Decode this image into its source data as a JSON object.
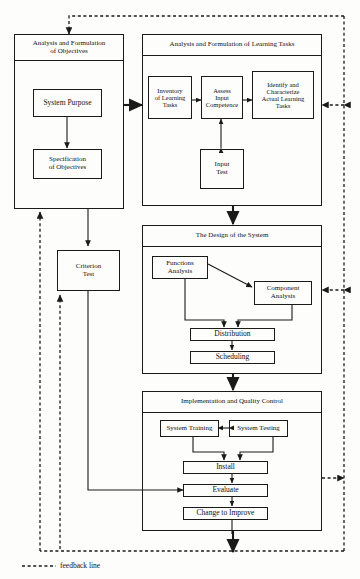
{
  "diagram": {
    "legend": {
      "feedback_label": "feedback line"
    },
    "colors": {
      "line": "#1a1a1a",
      "background": "#fdfdfc",
      "text": "#111111"
    },
    "panels": [
      {
        "id": "analysis-objectives",
        "title": "Analysis and Formulation of Objectives",
        "title_lines": [
          "Analysis and Formulation",
          "of Objectives"
        ],
        "boxes": [
          {
            "id": "system-purpose",
            "label": "System Purpose",
            "lines": [
              "System Purpose"
            ]
          },
          {
            "id": "specification-of-objectives",
            "label": "Specification of Objectives",
            "lines": [
              "Specification",
              "of Objectives"
            ]
          }
        ]
      },
      {
        "id": "analysis-learning-tasks",
        "title": "Analysis and Formulation of Learning Tasks",
        "title_lines": [
          "Analysis and Formulation of Learning Tasks"
        ],
        "boxes": [
          {
            "id": "inventory-of-learning-tasks",
            "label": "Inventory of Learning Tasks",
            "lines": [
              "Inventory",
              "of Learning",
              "Tasks"
            ]
          },
          {
            "id": "assess-input-competence",
            "label": "Assess Input Competence",
            "lines": [
              "Assess",
              "Input",
              "Competence"
            ]
          },
          {
            "id": "identify-characterize-actual-learning-tasks",
            "label": "Identify and Characterize Actual Learning Tasks",
            "lines": [
              "Identify and",
              "Characterize",
              "Actual Learning",
              "Tasks"
            ]
          },
          {
            "id": "input-test",
            "label": "Input Test",
            "lines": [
              "Input",
              "Test"
            ]
          }
        ]
      },
      {
        "id": "design-of-system",
        "title": "The Design of the System",
        "title_lines": [
          "The Design of the System"
        ],
        "boxes": [
          {
            "id": "functions-analysis",
            "label": "Functions Analysis",
            "lines": [
              "Functions",
              "Analysis"
            ]
          },
          {
            "id": "component-analysis",
            "label": "Component Analysis",
            "lines": [
              "Component",
              "Analysis"
            ]
          },
          {
            "id": "distribution",
            "label": "Distribution",
            "lines": [
              "Distribution"
            ]
          },
          {
            "id": "scheduling",
            "label": "Scheduling",
            "lines": [
              "Scheduling"
            ]
          }
        ]
      },
      {
        "id": "implementation-quality-control",
        "title": "Implementation and Quality Control",
        "title_lines": [
          "Implementation and Quality Control"
        ],
        "boxes": [
          {
            "id": "system-training",
            "label": "System Training",
            "lines": [
              "System Training"
            ]
          },
          {
            "id": "system-testing",
            "label": "System Testing",
            "lines": [
              "System Testing"
            ]
          },
          {
            "id": "install",
            "label": "Install",
            "lines": [
              "Install"
            ]
          },
          {
            "id": "evaluate",
            "label": "Evaluate",
            "lines": [
              "Evaluate"
            ]
          },
          {
            "id": "change-to-improve",
            "label": "Change to Improve",
            "lines": [
              "Change to Improve"
            ]
          }
        ]
      }
    ],
    "standalone_boxes": [
      {
        "id": "criterion-test",
        "label": "Criterion Test",
        "lines": [
          "Criterion",
          "Test"
        ]
      }
    ]
  }
}
